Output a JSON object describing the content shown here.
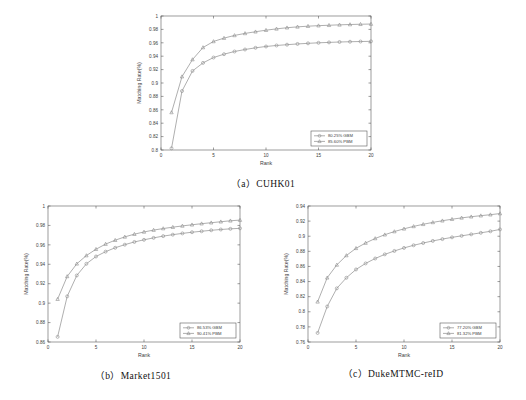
{
  "figure": {
    "kind": "cmc-curve-figure",
    "panels": [
      "a",
      "b",
      "c"
    ]
  },
  "captions": {
    "a": "（a）CUHK01",
    "b": "（b）Market1501",
    "c": "（c）DukeMTMC-reID"
  },
  "axis_titles": {
    "x": "Rank",
    "y": "Matching Rate(%)"
  },
  "colors": {
    "gbm_line": "#8c8c8c",
    "pbm_line": "#8c8c8c",
    "axis": "#5a5a5a",
    "background": "#ffffff",
    "text": "#3d3d3d"
  },
  "chart_data": [
    {
      "type": "line",
      "id": "cuhk01",
      "title": "（a）CUHK01",
      "xlabel": "Rank",
      "ylabel": "Matching Rate(%)",
      "xlim": [
        0,
        20
      ],
      "ylim": [
        0.8,
        1.0
      ],
      "xticks": [
        0,
        5,
        10,
        15,
        20
      ],
      "yticks": [
        0.8,
        0.82,
        0.84,
        0.86,
        0.88,
        0.9,
        0.92,
        0.94,
        0.96,
        0.98,
        1
      ],
      "ytick_labels": [
        "0.8",
        "0.82",
        "0.84",
        "0.86",
        "0.88",
        "0.9",
        "0.92",
        "0.94",
        "0.96",
        "0.98",
        "1"
      ],
      "grid": false,
      "legend_position": "lower right",
      "x": [
        1,
        2,
        3,
        4,
        5,
        6,
        7,
        8,
        9,
        10,
        11,
        12,
        13,
        14,
        15,
        16,
        17,
        18,
        19,
        20
      ],
      "series": [
        {
          "name": "80.25%  GBM",
          "marker": "circle",
          "values": [
            0.8025,
            0.888,
            0.918,
            0.93,
            0.938,
            0.943,
            0.947,
            0.95,
            0.9525,
            0.9545,
            0.956,
            0.9572,
            0.9583,
            0.9592,
            0.96,
            0.9606,
            0.9612,
            0.9616,
            0.9619,
            0.9622
          ]
        },
        {
          "name": "85.60%  PBM",
          "marker": "triangle",
          "values": [
            0.856,
            0.9095,
            0.935,
            0.953,
            0.962,
            0.967,
            0.971,
            0.974,
            0.9765,
            0.9788,
            0.9808,
            0.9825,
            0.9838,
            0.9848,
            0.9856,
            0.9862,
            0.9868,
            0.9873,
            0.9877,
            0.988
          ]
        }
      ]
    },
    {
      "type": "line",
      "id": "market1501",
      "title": "（b）Market1501",
      "xlabel": "Rank",
      "ylabel": "Matching Rate(%)",
      "xlim": [
        0,
        20
      ],
      "ylim": [
        0.86,
        1.0
      ],
      "xticks": [
        0,
        5,
        10,
        15,
        20
      ],
      "yticks": [
        0.86,
        0.88,
        0.9,
        0.92,
        0.94,
        0.96,
        0.98,
        1
      ],
      "ytick_labels": [
        "0.86",
        "0.88",
        "0.9",
        "0.92",
        "0.94",
        "0.96",
        "0.98",
        "1"
      ],
      "grid": false,
      "legend_position": "lower right",
      "x": [
        1,
        2,
        3,
        4,
        5,
        6,
        7,
        8,
        9,
        10,
        11,
        12,
        13,
        14,
        15,
        16,
        17,
        18,
        19,
        20
      ],
      "series": [
        {
          "name": "86.53%  GBM",
          "marker": "circle",
          "values": [
            0.8653,
            0.907,
            0.9285,
            0.9405,
            0.948,
            0.953,
            0.957,
            0.9602,
            0.963,
            0.9652,
            0.9672,
            0.969,
            0.9705,
            0.9718,
            0.973,
            0.974,
            0.975,
            0.9758,
            0.9765,
            0.977
          ]
        },
        {
          "name": "90.41%  PBM",
          "marker": "triangle",
          "values": [
            0.9041,
            0.9275,
            0.9405,
            0.949,
            0.9555,
            0.9608,
            0.9648,
            0.9682,
            0.971,
            0.9733,
            0.9752,
            0.9768,
            0.9782,
            0.9795,
            0.9807,
            0.9818,
            0.9828,
            0.9838,
            0.9848,
            0.9855
          ]
        }
      ]
    },
    {
      "type": "line",
      "id": "dukemtmc-reid",
      "title": "（c）DukeMTMC-reID",
      "xlabel": "Rank",
      "ylabel": "Matching Rate(%)",
      "xlim": [
        0,
        20
      ],
      "ylim": [
        0.76,
        0.94
      ],
      "xticks": [
        0,
        5,
        10,
        15,
        20
      ],
      "yticks": [
        0.76,
        0.78,
        0.8,
        0.82,
        0.84,
        0.86,
        0.88,
        0.9,
        0.92,
        0.94
      ],
      "ytick_labels": [
        "0.76",
        "0.78",
        "0.8",
        "0.82",
        "0.84",
        "0.86",
        "0.88",
        "0.9",
        "0.92",
        "0.94"
      ],
      "grid": false,
      "legend_position": "lower right",
      "x": [
        1,
        2,
        3,
        4,
        5,
        6,
        7,
        8,
        9,
        10,
        11,
        12,
        13,
        14,
        15,
        16,
        17,
        18,
        19,
        20
      ],
      "series": [
        {
          "name": "77.20%  GBM",
          "marker": "circle",
          "values": [
            0.772,
            0.807,
            0.831,
            0.845,
            0.856,
            0.864,
            0.8705,
            0.876,
            0.8805,
            0.8845,
            0.888,
            0.891,
            0.8938,
            0.8962,
            0.8985,
            0.9005,
            0.9025,
            0.9045,
            0.9065,
            0.909
          ]
        },
        {
          "name": "81.32%  PBM",
          "marker": "triangle",
          "values": [
            0.8132,
            0.845,
            0.862,
            0.8745,
            0.884,
            0.891,
            0.897,
            0.902,
            0.9062,
            0.9098,
            0.913,
            0.9158,
            0.9183,
            0.9205,
            0.9225,
            0.9243,
            0.9258,
            0.9272,
            0.9285,
            0.93
          ]
        }
      ]
    }
  ]
}
